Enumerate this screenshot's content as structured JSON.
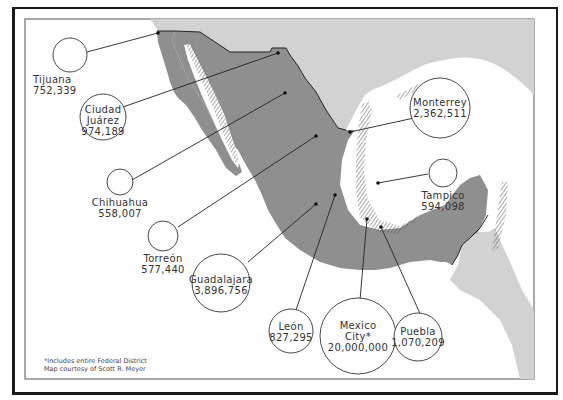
{
  "map": {
    "title": "Major Cities of Mexico",
    "colors": {
      "mexico": "#8f8f8f",
      "neighbors": "#d2d2d2",
      "water": "#ffffff",
      "line": "#222222",
      "text": "#333333"
    },
    "cities": [
      {
        "name": "Tijuana",
        "population": "752,339"
      },
      {
        "name": "Ciudad Juárez",
        "name_line1": "Ciudad",
        "name_line2": "Juárez",
        "population": "974,189"
      },
      {
        "name": "Chihuahua",
        "population": "558,007"
      },
      {
        "name": "Torreón",
        "population": "577,440"
      },
      {
        "name": "Guadalajara",
        "population": "3,896,756"
      },
      {
        "name": "León",
        "population": "827,295"
      },
      {
        "name": "Mexico City*",
        "name_line1": "Mexico",
        "name_line2": "City*",
        "population": "20,000,000"
      },
      {
        "name": "Puebla",
        "population": "1,070,209"
      },
      {
        "name": "Tampico",
        "population": "594,098"
      },
      {
        "name": "Monterrey",
        "population": "2,362,511"
      }
    ],
    "footnote": {
      "line1": "*Includes entire Federal District",
      "line2": "Map courtesy of Scott R. Meyer"
    }
  }
}
